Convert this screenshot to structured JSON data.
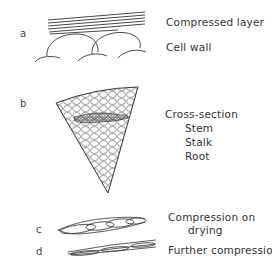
{
  "figure": {
    "panels": [
      {
        "id": "a",
        "tag": "a",
        "labels": [
          "Compressed layer",
          "Cell wall"
        ]
      },
      {
        "id": "b",
        "tag": "b",
        "labels": [
          "Cross-section",
          "Stem",
          "Stalk",
          "Root"
        ]
      },
      {
        "id": "c",
        "tag": "c",
        "labels": [
          "Compression on",
          "drying"
        ]
      },
      {
        "id": "d",
        "tag": "d",
        "labels": [
          "Further compression"
        ]
      }
    ],
    "colors": {
      "line": "#333333",
      "text": "#333333",
      "background": "#ffffff"
    }
  }
}
